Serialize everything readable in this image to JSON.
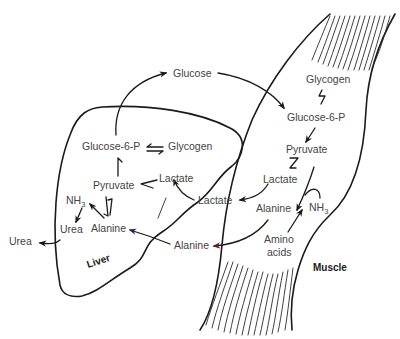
{
  "diagram": {
    "organs": {
      "liver": "Liver",
      "muscle": "Muscle"
    },
    "blood": {
      "glucose": "Glucose",
      "lactate": "Lactate",
      "alanine": "Alanine"
    },
    "liver_nodes": {
      "glucose6p": "Glucose-6-P",
      "glycogen": "Glycogen",
      "pyruvate": "Pyruvate",
      "lactate": "Lactate",
      "nh3": "NH",
      "nh3_sub": "3",
      "urea": "Urea",
      "alanine": "Alanine"
    },
    "outside": {
      "urea": "Urea"
    },
    "muscle_nodes": {
      "glycogen": "Glycogen",
      "glucose6p": "Glucose-6-P",
      "pyruvate": "Pyruvate",
      "lactate": "Lactate",
      "alanine": "Alanine",
      "nh3": "NH",
      "nh3_sub": "3",
      "amino": "Amino",
      "acids": "acids"
    },
    "colors": {
      "line": "#1a1a1a",
      "text": "#444444",
      "alanine_arrowhead": "#1a237e",
      "muscle_alanine_arrowhead": "#5a1a1a"
    }
  }
}
